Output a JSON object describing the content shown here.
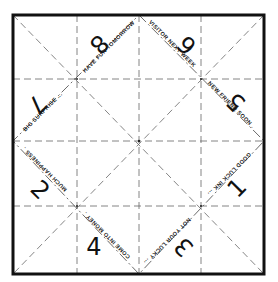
{
  "template": {
    "title": "Paper fortune teller template",
    "border_color": "#111111",
    "fold_line_color": "#555555"
  },
  "numbers": [
    {
      "id": "n8",
      "label": "8"
    },
    {
      "id": "n6",
      "label": "6"
    },
    {
      "id": "n7",
      "label": "7"
    },
    {
      "id": "n5",
      "label": "5"
    },
    {
      "id": "n2",
      "label": "2"
    },
    {
      "id": "n1",
      "label": "1"
    },
    {
      "id": "n4",
      "label": "4"
    },
    {
      "id": "n3",
      "label": "3"
    }
  ],
  "fortunes": [
    {
      "id": "f1",
      "text": "HAVE FUN TOMORROW"
    },
    {
      "id": "f2",
      "text": "VISITOR NEXT WEEK"
    },
    {
      "id": "f3",
      "text": "BIG SURPRISE ..."
    },
    {
      "id": "f4",
      "text": "NEW FRIEND SOON ."
    },
    {
      "id": "f5",
      "text": "MUCH HAPPINESS ."
    },
    {
      "id": "f6",
      "text": "GOOD LUCK INK ..."
    },
    {
      "id": "f7",
      "text": "COME INTO MONEY ."
    },
    {
      "id": "f8",
      "text": "NOT YOUR LUCKY ..."
    }
  ]
}
